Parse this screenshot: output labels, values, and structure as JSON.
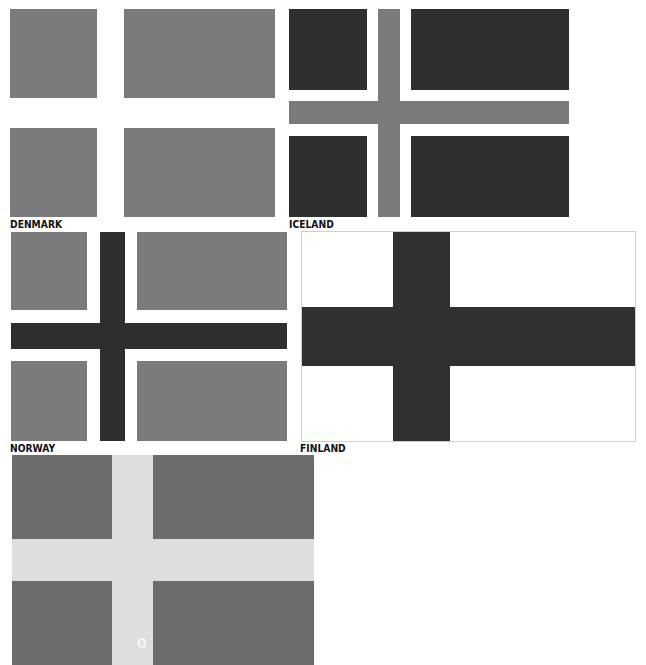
{
  "flags": [
    {
      "name": "DENMARK",
      "panel_color": "#7b7b7b",
      "cross_color": "#ffffff"
    },
    {
      "name": "ICELAND",
      "panel_color": "#2f2f2f",
      "cross_border_color": "#ffffff",
      "cross_color": "#7a7a7a"
    },
    {
      "name": "NORWAY",
      "panel_color": "#7b7b7b",
      "cross_border_color": "#ffffff",
      "cross_color": "#2e2e2e"
    },
    {
      "name": "FINLAND",
      "panel_color": "#ffffff",
      "cross_color": "#303030"
    },
    {
      "name": "",
      "panel_color": "#6c6c6c",
      "cross_color": "#dedede",
      "mark": "0"
    }
  ]
}
